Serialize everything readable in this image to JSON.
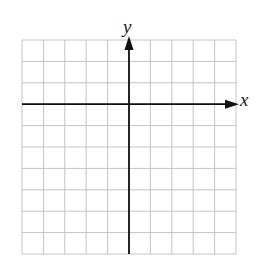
{
  "diagram": {
    "type": "coordinate-grid",
    "grid": {
      "columns": 10,
      "rows": 10,
      "left": 22,
      "top": 40,
      "cell_size": 21.4,
      "line_color": "#c4c4c4"
    },
    "axes": {
      "color": "#111111",
      "origin_column": 5,
      "origin_row": 3,
      "x_label": "x",
      "y_label": "y",
      "x_arrow": "right",
      "y_arrow": "up"
    }
  }
}
